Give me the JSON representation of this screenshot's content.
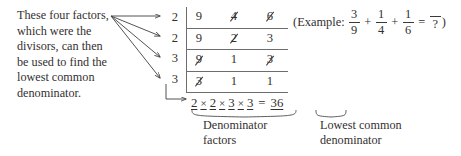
{
  "explanation": {
    "lines": [
      "These four factors,",
      "which were the",
      "divisors, can then",
      "be used to find the",
      "lowest common",
      "denominator."
    ]
  },
  "ladder": {
    "divisors": [
      "2",
      "2",
      "3",
      "3"
    ],
    "rows": [
      [
        {
          "value": "9",
          "struck": false
        },
        {
          "value": "4",
          "struck": true
        },
        {
          "value": "6",
          "struck": true
        }
      ],
      [
        {
          "value": "9",
          "struck": false
        },
        {
          "value": "2",
          "struck": true
        },
        {
          "value": "3",
          "struck": false
        }
      ],
      [
        {
          "value": "9",
          "struck": true
        },
        {
          "value": "1",
          "struck": false
        },
        {
          "value": "3",
          "struck": true
        }
      ],
      [
        {
          "value": "3",
          "struck": true
        },
        {
          "value": "1",
          "struck": false
        },
        {
          "value": "1",
          "struck": false
        }
      ]
    ]
  },
  "example": {
    "open_paren": "(",
    "label": "Example:",
    "fraction1": {
      "numerator": "3",
      "denominator": "9"
    },
    "plus1": "+",
    "fraction2": {
      "numerator": "1",
      "denominator": "4"
    },
    "plus2": "+",
    "fraction3": {
      "numerator": "1",
      "denominator": "6"
    },
    "equals": "=",
    "result": {
      "numerator": "",
      "denominator": "?"
    },
    "close_paren": ")"
  },
  "equation": {
    "factor1": "2",
    "times1": "×",
    "factor2": "2",
    "times2": "×",
    "factor3": "3",
    "times3": "×",
    "factor4": "3",
    "equals": "=",
    "product": "36"
  },
  "captions": {
    "left": [
      "Denominator",
      "factors"
    ],
    "right": [
      "Lowest common",
      "denominator"
    ]
  },
  "colors": {
    "ink": "#333030",
    "rule": "#6d6d6d",
    "background": "#ffffff"
  }
}
